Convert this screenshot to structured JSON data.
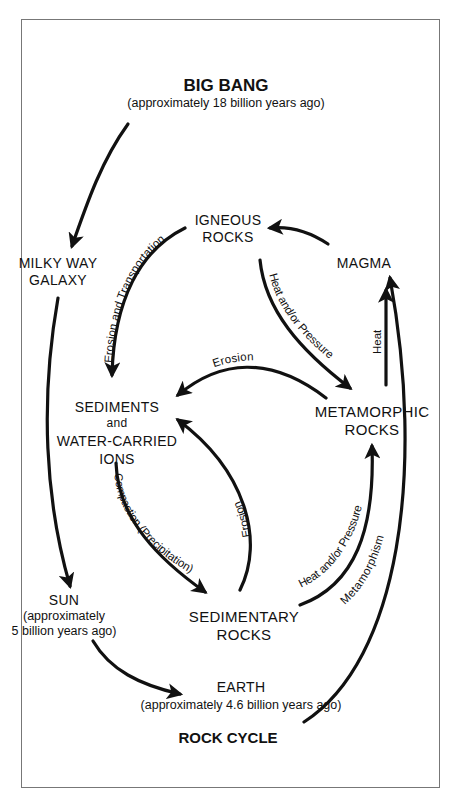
{
  "diagram": {
    "title": "ROCK CYCLE",
    "nodes": {
      "big_bang": {
        "label": "BIG BANG",
        "sub": "(approximately 18 billion years ago)"
      },
      "milky_way": {
        "line1": "MILKY WAY",
        "line2": "GALAXY"
      },
      "sun": {
        "label": "SUN",
        "sub1": "(approximately",
        "sub2": "5 billion years ago)"
      },
      "earth": {
        "label": "EARTH",
        "sub": "(approximately 4.6 billion years ago)"
      },
      "igneous": {
        "line1": "IGNEOUS",
        "line2": "ROCKS"
      },
      "magma": {
        "label": "MAGMA"
      },
      "sediments": {
        "line1": "SEDIMENTS",
        "line2": "and",
        "line3": "WATER-CARRIED",
        "line4": "IONS"
      },
      "metamorphic": {
        "line1": "METAMORPHIC",
        "line2": "ROCKS"
      },
      "sedimentary": {
        "line1": "SEDIMENTARY",
        "line2": "ROCKS"
      }
    },
    "edges": [
      {
        "from": "big_bang",
        "to": "milky_way",
        "label": ""
      },
      {
        "from": "milky_way",
        "to": "sun",
        "label": ""
      },
      {
        "from": "sun",
        "to": "earth",
        "label": ""
      },
      {
        "from": "earth",
        "to": "magma",
        "label": ""
      },
      {
        "from": "magma",
        "to": "igneous",
        "label": ""
      },
      {
        "from": "igneous",
        "to": "sediments",
        "label": "Erosion and Transportation"
      },
      {
        "from": "igneous",
        "to": "metamorphic",
        "label": "Heat and/or Pressure"
      },
      {
        "from": "metamorphic",
        "to": "magma",
        "label": "Heat"
      },
      {
        "from": "metamorphic",
        "to": "sediments",
        "label": "Erosion"
      },
      {
        "from": "sediments",
        "to": "sedimentary",
        "label": "Compaction (Precipitation)"
      },
      {
        "from": "sedimentary",
        "to": "sediments",
        "label": "Erosion"
      },
      {
        "from": "sedimentary",
        "to": "metamorphic",
        "label": "Heat and/or Pressure",
        "label2": "Metamorphism"
      }
    ]
  }
}
